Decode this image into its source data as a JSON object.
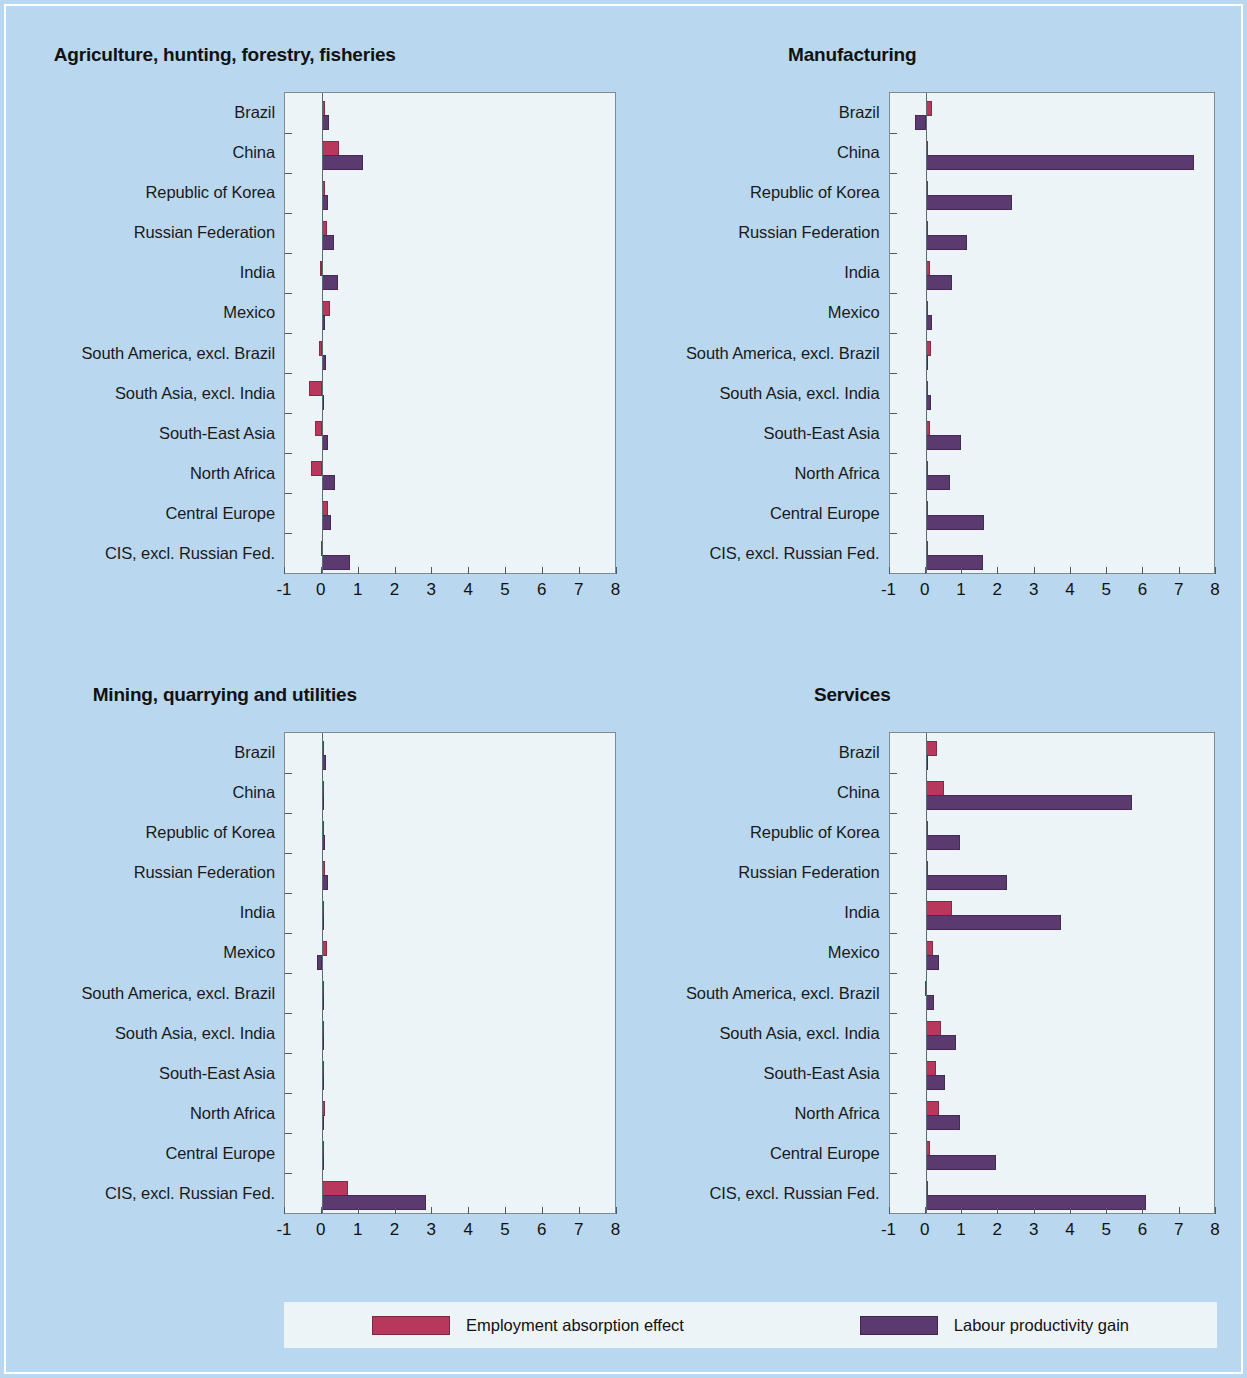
{
  "legend": {
    "items": [
      {
        "label": "Employment absorption effect",
        "color": "#b8375c",
        "key": "employment"
      },
      {
        "label": "Labour productivity gain",
        "color": "#5b3a70",
        "key": "productivity"
      }
    ]
  },
  "background_color": "#b9d7ef",
  "plot_background_color": "#edf4f8",
  "chart_data": [
    {
      "type": "bar",
      "orientation": "horizontal",
      "title": "Agriculture, hunting, forestry, fisheries",
      "xlabel": "",
      "ylabel": "",
      "xlim": [
        -1,
        8
      ],
      "xticks": [
        -1,
        0,
        1,
        2,
        3,
        4,
        5,
        6,
        7,
        8
      ],
      "ticklabels": [
        "-1",
        "0",
        "1",
        "2",
        "3",
        "4",
        "5",
        "6",
        "7",
        "8"
      ],
      "grid": false,
      "legend_position": "bottom",
      "categories": [
        "Brazil",
        "China",
        "Republic of Korea",
        "Russian Federation",
        "India",
        "Mexico",
        "South America, excl. Brazil",
        "South Asia, excl. India",
        "South-East Asia",
        "North Africa",
        "Central Europe",
        "CIS, excl. Russian Fed."
      ],
      "series": [
        {
          "name": "Employment absorption effect",
          "color": "#b8375c",
          "values": [
            0.1,
            0.48,
            0.08,
            0.14,
            -0.04,
            0.22,
            -0.06,
            -0.35,
            -0.18,
            -0.3,
            0.17,
            -0.03
          ]
        },
        {
          "name": "Labour productivity gain",
          "color": "#5b3a70",
          "values": [
            0.2,
            1.12,
            0.18,
            0.33,
            0.45,
            0.08,
            0.12,
            0.02,
            0.17,
            0.36,
            0.25,
            0.78
          ]
        }
      ]
    },
    {
      "type": "bar",
      "orientation": "horizontal",
      "title": "Manufacturing",
      "xlabel": "",
      "ylabel": "",
      "xlim": [
        -1,
        8
      ],
      "xticks": [
        -1,
        0,
        1,
        2,
        3,
        4,
        5,
        6,
        7,
        8
      ],
      "ticklabels": [
        "-1",
        "0",
        "1",
        "2",
        "3",
        "4",
        "5",
        "6",
        "7",
        "8"
      ],
      "grid": false,
      "legend_position": "bottom",
      "categories": [
        "Brazil",
        "China",
        "Republic of Korea",
        "Russian Federation",
        "India",
        "Mexico",
        "South America, excl. Brazil",
        "South Asia, excl. India",
        "South-East Asia",
        "North Africa",
        "Central Europe",
        "CIS, excl. Russian Fed."
      ],
      "series": [
        {
          "name": "Employment absorption effect",
          "color": "#b8375c",
          "values": [
            0.17,
            0.05,
            0.0,
            0.01,
            0.12,
            0.05,
            0.14,
            0.05,
            0.13,
            0.0,
            0.01,
            0.03
          ]
        },
        {
          "name": "Labour productivity gain",
          "color": "#5b3a70",
          "values": [
            -0.3,
            7.45,
            2.4,
            1.15,
            0.72,
            0.18,
            0.02,
            0.14,
            0.97,
            0.68,
            1.62,
            1.58
          ]
        }
      ]
    },
    {
      "type": "bar",
      "orientation": "horizontal",
      "title": "Mining, quarrying and utilities",
      "xlabel": "",
      "ylabel": "",
      "xlim": [
        -1,
        8
      ],
      "xticks": [
        -1,
        0,
        1,
        2,
        3,
        4,
        5,
        6,
        7,
        8
      ],
      "ticklabels": [
        "-1",
        "0",
        "1",
        "2",
        "3",
        "4",
        "5",
        "6",
        "7",
        "8"
      ],
      "grid": false,
      "legend_position": "bottom",
      "categories": [
        "Brazil",
        "China",
        "Republic of Korea",
        "Russian Federation",
        "India",
        "Mexico",
        "South America, excl. Brazil",
        "South Asia, excl. India",
        "South-East Asia",
        "North Africa",
        "Central Europe",
        "CIS, excl. Russian Fed."
      ],
      "series": [
        {
          "name": "Employment absorption effect",
          "color": "#b8375c",
          "values": [
            0.0,
            0.03,
            0.0,
            0.1,
            0.06,
            0.15,
            0.07,
            0.03,
            0.05,
            0.1,
            0.02,
            0.72
          ]
        },
        {
          "name": "Labour productivity gain",
          "color": "#5b3a70",
          "values": [
            0.13,
            0.0,
            0.09,
            0.17,
            0.02,
            -0.12,
            0.03,
            0.06,
            0.02,
            0.05,
            0.06,
            2.85
          ]
        }
      ]
    },
    {
      "type": "bar",
      "orientation": "horizontal",
      "title": "Services",
      "xlabel": "",
      "ylabel": "",
      "xlim": [
        -1,
        8
      ],
      "xticks": [
        -1,
        0,
        1,
        2,
        3,
        4,
        5,
        6,
        7,
        8
      ],
      "ticklabels": [
        "-1",
        "0",
        "1",
        "2",
        "3",
        "4",
        "5",
        "6",
        "7",
        "8"
      ],
      "grid": false,
      "legend_position": "bottom",
      "categories": [
        "Brazil",
        "China",
        "Republic of Korea",
        "Russian Federation",
        "India",
        "Mexico",
        "South America, excl. Brazil",
        "South Asia, excl. India",
        "South-East Asia",
        "North Africa",
        "Central Europe",
        "CIS, excl. Russian Fed."
      ],
      "series": [
        {
          "name": "Employment absorption effect",
          "color": "#b8375c",
          "values": [
            0.33,
            0.5,
            0.06,
            0.0,
            0.72,
            0.22,
            -0.02,
            0.42,
            0.28,
            0.38,
            0.12,
            0.0
          ]
        },
        {
          "name": "Labour productivity gain",
          "color": "#5b3a70",
          "values": [
            0.02,
            5.72,
            0.95,
            2.25,
            3.75,
            0.38,
            0.24,
            0.85,
            0.55,
            0.96,
            1.95,
            6.12
          ]
        }
      ]
    }
  ]
}
